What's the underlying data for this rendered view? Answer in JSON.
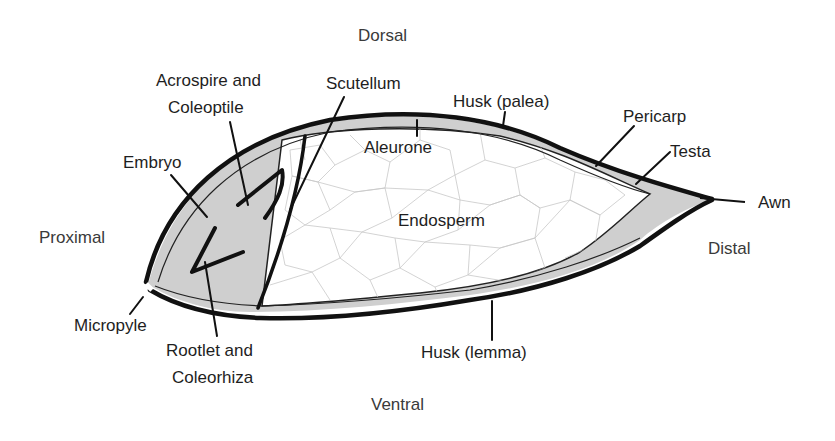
{
  "orientation": {
    "top": "Dorsal",
    "bottom": "Ventral",
    "left": "Proximal",
    "right": "Distal"
  },
  "labels": {
    "acrospire_line1": "Acrospire and",
    "acrospire_line2": "Coleoptile",
    "scutellum": "Scutellum",
    "husk_palea": "Husk (palea)",
    "pericarp": "Pericarp",
    "testa": "Testa",
    "awn": "Awn",
    "embryo": "Embryo",
    "aleurone": "Aleurone",
    "endosperm": "Endosperm",
    "micropyle": "Micropyle",
    "rootlet_line1": "Rootlet and",
    "rootlet_line2": "Coleorhiza",
    "husk_lemma": "Husk (lemma)"
  },
  "colors": {
    "outline": "#111111",
    "seed_coat_fill": "#cfcfcf",
    "endosperm_fill": "#ffffff",
    "cell_lines": "#c8c8c8",
    "text": "#1e1e1e"
  }
}
